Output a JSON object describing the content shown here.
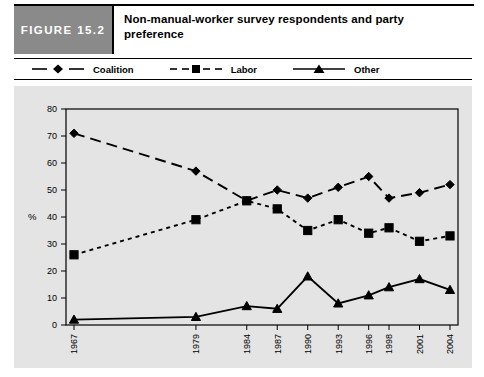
{
  "header": {
    "figure_tag": "FIGURE 15.2",
    "title": "Non-manual-worker survey respondents and party preference",
    "tag_bg": "#8a8a8a",
    "title_color": "#000000"
  },
  "legend": {
    "position": "top",
    "items": [
      {
        "label": "Coalition",
        "marker": "diamond",
        "dash": "long-dash",
        "color": "#000000"
      },
      {
        "label": "Labor",
        "marker": "square",
        "dash": "short-dash",
        "color": "#000000"
      },
      {
        "label": "Other",
        "marker": "triangle",
        "dash": "solid",
        "color": "#000000"
      }
    ]
  },
  "chart_data": {
    "type": "line",
    "title": "Non-manual-worker survey respondents and party preference",
    "xlabel": "",
    "ylabel": "%",
    "categories": [
      "1967",
      "1979",
      "1984",
      "1987",
      "1990",
      "1993",
      "1996",
      "1998",
      "2001",
      "2004"
    ],
    "ylim": [
      0,
      80
    ],
    "yticks": [
      0,
      10,
      20,
      30,
      40,
      50,
      60,
      70,
      80
    ],
    "grid": false,
    "plot_background": "#e4e4e4",
    "series": [
      {
        "name": "Coalition",
        "marker": "diamond",
        "dash": "long-dash",
        "values": [
          71,
          57,
          46,
          50,
          47,
          51,
          55,
          47,
          49,
          52
        ]
      },
      {
        "name": "Labor",
        "marker": "square",
        "dash": "short-dash",
        "values": [
          26,
          39,
          46,
          43,
          35,
          39,
          34,
          36,
          31,
          33
        ]
      },
      {
        "name": "Other",
        "marker": "triangle",
        "dash": "solid",
        "values": [
          2,
          3,
          7,
          6,
          18,
          8,
          11,
          14,
          17,
          13
        ]
      }
    ]
  }
}
